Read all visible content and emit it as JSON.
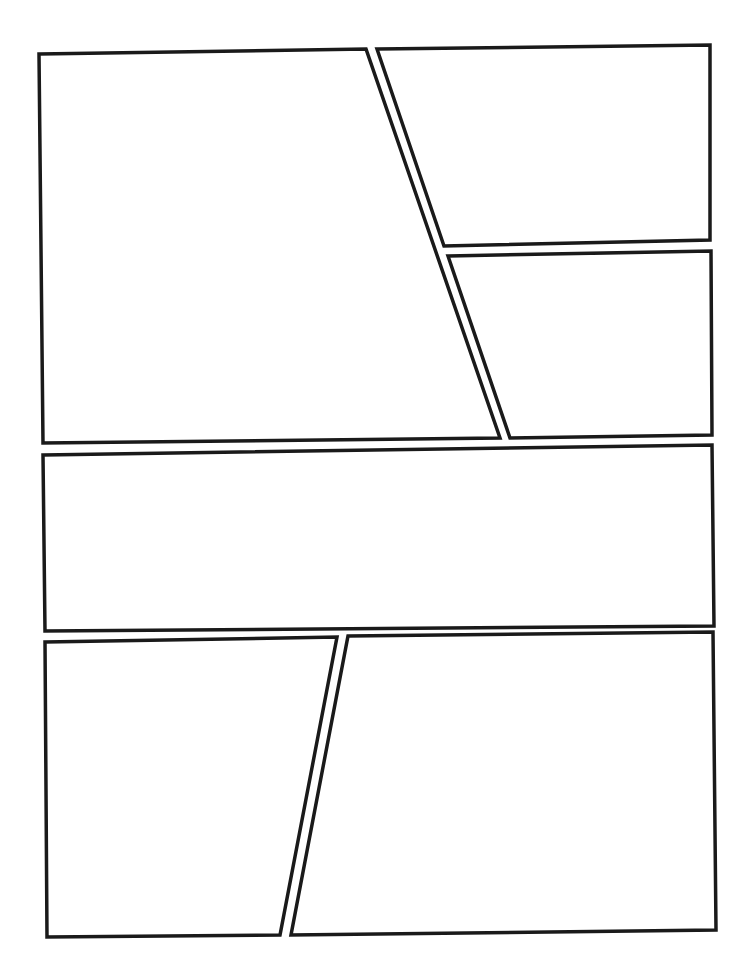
{
  "page": {
    "type": "comic-page-template",
    "width": 747,
    "height": 969,
    "background": "#ffffff",
    "border_color": "#1a1a1a"
  },
  "panels": [
    {
      "id": "panel-1",
      "points": "39,54 366,49 500,438 43,443"
    },
    {
      "id": "panel-2",
      "points": "377,49 710,45 710,240 444,246"
    },
    {
      "id": "panel-3",
      "points": "448,256 711,251 712,435 510,438"
    },
    {
      "id": "panel-4",
      "points": "43,455 712,445 714,626 45,631"
    },
    {
      "id": "panel-5",
      "points": "45,642 337,637 280,935 47,937"
    },
    {
      "id": "panel-6",
      "points": "348,636 713,632 716,930 291,935"
    }
  ]
}
